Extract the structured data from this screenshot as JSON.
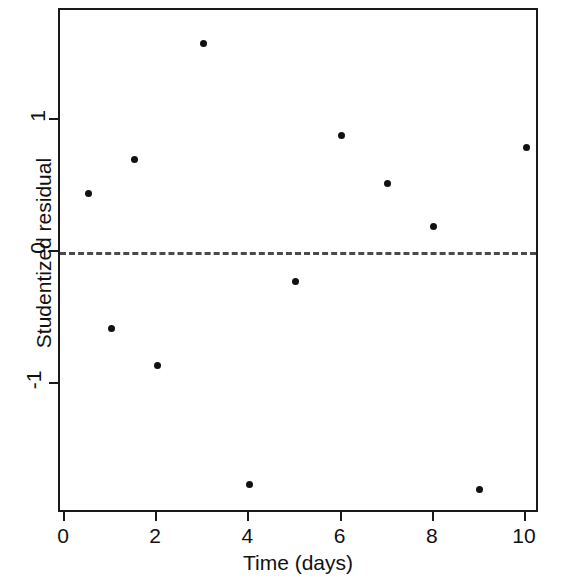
{
  "chart_data": {
    "type": "scatter",
    "title": "",
    "xlabel": "Time (days)",
    "ylabel": "Studentized residual",
    "x": [
      0.5,
      1,
      1.5,
      2,
      3,
      4,
      5,
      6,
      7,
      8,
      9,
      10
    ],
    "y": [
      0.44,
      -0.58,
      0.7,
      -0.86,
      1.58,
      -1.76,
      -0.22,
      0.88,
      0.52,
      0.19,
      -1.8,
      0.79
    ],
    "points": [
      {
        "x": 0.5,
        "y": 0.44
      },
      {
        "x": 1,
        "y": -0.58
      },
      {
        "x": 1.5,
        "y": 0.7
      },
      {
        "x": 2,
        "y": -0.86
      },
      {
        "x": 3,
        "y": 1.58
      },
      {
        "x": 4,
        "y": -1.76
      },
      {
        "x": 5,
        "y": -0.22
      },
      {
        "x": 6,
        "y": 0.88
      },
      {
        "x": 7,
        "y": 0.52
      },
      {
        "x": 8,
        "y": 0.19
      },
      {
        "x": 9,
        "y": -1.8
      },
      {
        "x": 10,
        "y": 0.79
      }
    ],
    "xticks": [
      0,
      2,
      4,
      6,
      8,
      10
    ],
    "xtick_labels": [
      "0",
      "2",
      "4",
      "6",
      "8",
      "10"
    ],
    "yticks": [
      1,
      0,
      -1
    ],
    "ytick_labels": [
      "1",
      "0",
      "-1"
    ],
    "xlim": [
      -0.1,
      10.4
    ],
    "ylim": [
      -1.98,
      1.82
    ],
    "grid": false,
    "legend": null,
    "annotations": [
      {
        "type": "hline",
        "y": 0,
        "style": "dashed",
        "color": "#4a4a4a"
      }
    ],
    "marker": "filled-circle",
    "marker_color": "#111111"
  },
  "colors": {
    "axis": "#1a1a1a",
    "marker": "#111111",
    "reference_line": "#4a4a4a",
    "background": "#ffffff"
  }
}
